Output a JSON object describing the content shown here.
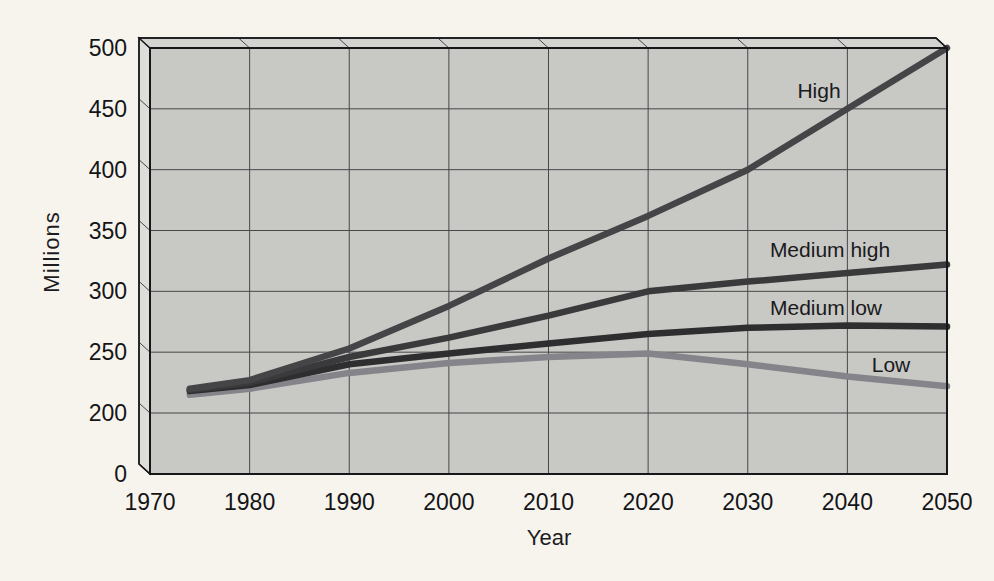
{
  "chart_data": {
    "type": "line",
    "title": "",
    "xlabel": "Year",
    "ylabel": "Millions",
    "x_ticks": [
      1970,
      1980,
      1990,
      2000,
      2010,
      2020,
      2030,
      2040,
      2050
    ],
    "y_ticks": [
      0,
      200,
      250,
      300,
      350,
      400,
      450,
      500
    ],
    "xlim": [
      1970,
      2050
    ],
    "ylim": [
      0,
      500
    ],
    "y_axis_break": "segment 0-200 compressed to one gridline step",
    "grid": true,
    "legend_position": "inline-labels-on-plot",
    "x": [
      1974,
      1980,
      1990,
      2000,
      2010,
      2020,
      2030,
      2040,
      2050
    ],
    "series": [
      {
        "name": "Low",
        "color": "#84848a",
        "values": [
          215,
          220,
          233,
          241,
          246,
          249,
          240,
          230,
          222
        ],
        "label_pos": {
          "x": 891,
          "y": 365
        }
      },
      {
        "name": "Medium low",
        "color": "#2e2e30",
        "values": [
          218,
          223,
          240,
          249,
          257,
          265,
          270,
          272,
          271
        ],
        "label_pos": {
          "x": 826,
          "y": 308
        }
      },
      {
        "name": "Medium high",
        "color": "#3a3a3c",
        "values": [
          219,
          225,
          246,
          262,
          280,
          300,
          308,
          315,
          322
        ],
        "label_pos": {
          "x": 830,
          "y": 250
        }
      },
      {
        "name": "High",
        "color": "#454547",
        "values": [
          220,
          227,
          253,
          288,
          327,
          362,
          400,
          450,
          500
        ],
        "label_pos": {
          "x": 819,
          "y": 91
        }
      }
    ],
    "colors": {
      "page_bg": "#f7f4ee",
      "plot_face": "#c8c8c5",
      "top_face": "#d3d3d0",
      "left_face": "#dddddA",
      "gridline": "#47474a",
      "outline": "#17171a",
      "tick_text": "#151517",
      "label_text": "#1a1a1c"
    }
  }
}
